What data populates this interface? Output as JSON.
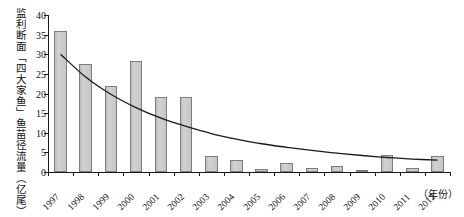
{
  "chart_data": {
    "type": "bar",
    "title": "",
    "subtitle": "",
    "xlabel": "（年份）",
    "ylabel": "监利断面「四大家鱼」鱼苗径流量（亿尾）",
    "categories": [
      "1997",
      "1998",
      "1999",
      "2000",
      "2001",
      "2002",
      "2003",
      "2004",
      "2005",
      "2006",
      "2007",
      "2008",
      "2009",
      "2010",
      "2011",
      "2012"
    ],
    "values": [
      35.9,
      27.5,
      21.8,
      28.4,
      19.1,
      19.1,
      4.2,
      3.0,
      0.7,
      2.4,
      1.0,
      1.6,
      0.5,
      4.4,
      1.1,
      4.0
    ],
    "series": [
      {
        "name": "监利断面四大家鱼鱼苗径流量",
        "type": "bar",
        "values": [
          35.9,
          27.5,
          21.8,
          28.4,
          19.1,
          19.1,
          4.2,
          3.0,
          0.7,
          2.4,
          1.0,
          1.6,
          0.5,
          4.4,
          1.1,
          4.0
        ]
      },
      {
        "name": "趋势线",
        "type": "line",
        "values": [
          30.0,
          24.2,
          19.8,
          16.4,
          13.7,
          11.6,
          9.8,
          8.4,
          7.2,
          6.3,
          5.5,
          4.8,
          4.2,
          3.7,
          3.3,
          3.0
        ]
      }
    ],
    "ylim": [
      0,
      40
    ],
    "yticks": [
      0,
      5,
      10,
      15,
      20,
      25,
      30,
      35,
      40
    ],
    "ytick_labels": [
      "0",
      "5",
      "10",
      "15",
      "20",
      "25",
      "30",
      "35",
      "40"
    ],
    "grid": false,
    "legend": "none",
    "bar_color": "#c9c9c9",
    "bar_edge_color": "#7d7d7d",
    "curve_color": "#1a1a1a",
    "axis_color": "#1a1a1a"
  }
}
